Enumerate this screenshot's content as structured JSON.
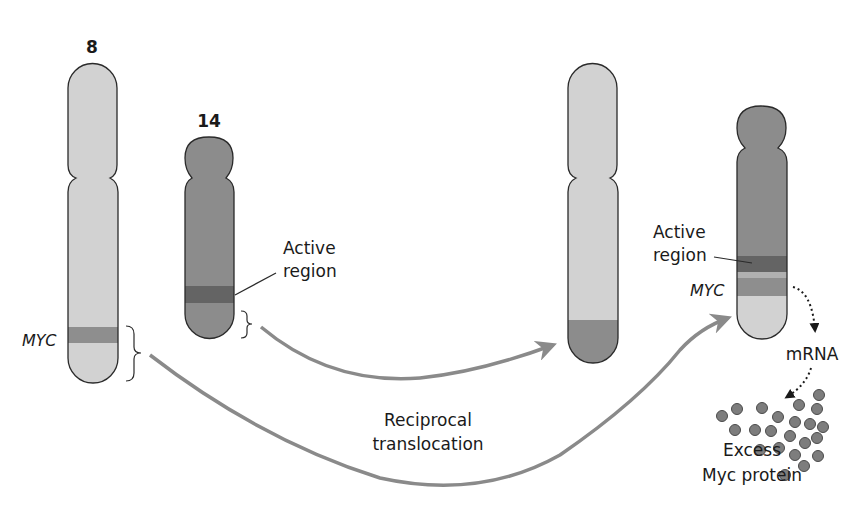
{
  "figure": {
    "chromosome_labels": {
      "chr8": "8",
      "chr14": "14"
    },
    "gene_label_left": "MYC",
    "gene_label_right": "MYC",
    "active_region_left": {
      "line1": "Active",
      "line2": "region"
    },
    "active_region_right": {
      "line1": "Active",
      "line2": "region"
    },
    "process_label": {
      "line1": "Reciprocal",
      "line2": "translocation"
    },
    "mrna_label": "mRNA",
    "protein_label": {
      "line1": "Excess",
      "line2": "Myc protein"
    },
    "colors": {
      "chr8_fill": "#d2d2d2",
      "chr14_fill": "#8c8c8c",
      "myc_band": "#8e8e8e",
      "active_band": "#646464",
      "arrow": "#8a8a8a",
      "protein_dot": "#7d7d7d",
      "outline": "#2a2a2a"
    }
  }
}
